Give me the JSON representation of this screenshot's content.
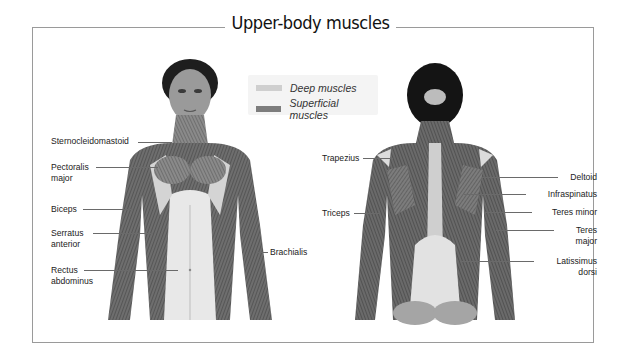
{
  "title": "Upper-body muscles",
  "legend": {
    "items": [
      {
        "label": "Deep muscles",
        "color": "#cfcfcf"
      },
      {
        "label": "Superficial muscles",
        "color": "#7d7d7d"
      }
    ]
  },
  "figures": {
    "front": {
      "view": "anterior"
    },
    "back": {
      "view": "posterior"
    }
  },
  "labels": {
    "front": [
      {
        "text": "Sternocleidomastoid"
      },
      {
        "text": "Pectoralis\nmajor"
      },
      {
        "text": "Biceps"
      },
      {
        "text": "Serratus\nanterior"
      },
      {
        "text": "Rectus\nabdominus"
      },
      {
        "text": "Brachialis"
      }
    ],
    "back": [
      {
        "text": "Trapezius"
      },
      {
        "text": "Triceps"
      },
      {
        "text": "Deltoid"
      },
      {
        "text": "Infraspinatus"
      },
      {
        "text": "Teres minor"
      },
      {
        "text": "Teres\nmajor"
      },
      {
        "text": "Latissimus\ndorsi"
      }
    ]
  },
  "colors": {
    "frame": "#9a9a9a",
    "deep": "#cfcfcf",
    "superficial": "#7d7d7d",
    "hair": "#1a1a1a",
    "skin": "#8c8c8c"
  }
}
